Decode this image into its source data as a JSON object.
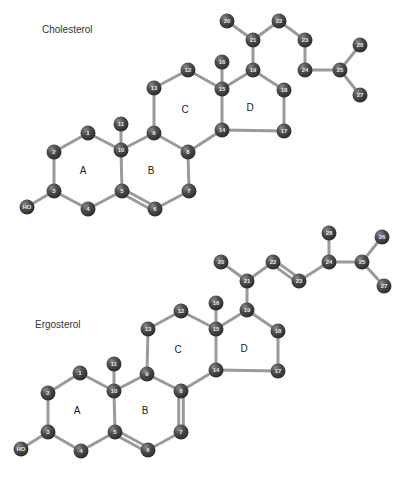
{
  "style": {
    "atom_color": "#4a4a4a",
    "atom_highlight": "#8a8a8a",
    "bond_color": "#9a9a9a",
    "label_color": "#e8e8e8",
    "atom_radius": 7.5
  },
  "molecules": [
    {
      "name": "Cholesterol",
      "title_pos": [
        42,
        33
      ],
      "ring_labels": [
        {
          "text": "A",
          "x": 83,
          "y": 171
        },
        {
          "text": "B",
          "x": 151,
          "y": 171
        },
        {
          "text": "C",
          "x": 185,
          "y": 110
        },
        {
          "text": "D",
          "x": 250,
          "y": 108
        }
      ],
      "atoms": [
        {
          "id": "1",
          "x": 88,
          "y": 133
        },
        {
          "id": "2",
          "x": 54,
          "y": 152
        },
        {
          "id": "3",
          "x": 54,
          "y": 191
        },
        {
          "id": "4",
          "x": 88,
          "y": 209
        },
        {
          "id": "5",
          "x": 122,
          "y": 191
        },
        {
          "id": "6",
          "x": 155,
          "y": 209
        },
        {
          "id": "7",
          "x": 189,
          "y": 191
        },
        {
          "id": "8",
          "x": 188,
          "y": 152
        },
        {
          "id": "9",
          "x": 154,
          "y": 133
        },
        {
          "id": "10",
          "x": 121,
          "y": 150
        },
        {
          "id": "11",
          "x": 121,
          "y": 124
        },
        {
          "id": "12",
          "x": 188,
          "y": 70
        },
        {
          "id": "13",
          "x": 154,
          "y": 88
        },
        {
          "id": "14",
          "x": 222,
          "y": 130
        },
        {
          "id": "15",
          "x": 222,
          "y": 89
        },
        {
          "id": "16",
          "x": 222,
          "y": 62
        },
        {
          "id": "17",
          "x": 284,
          "y": 131
        },
        {
          "id": "18",
          "x": 284,
          "y": 90
        },
        {
          "id": "19",
          "x": 253,
          "y": 70
        },
        {
          "id": "20",
          "x": 227,
          "y": 21
        },
        {
          "id": "21",
          "x": 253,
          "y": 40
        },
        {
          "id": "22",
          "x": 279,
          "y": 21
        },
        {
          "id": "23",
          "x": 305,
          "y": 40
        },
        {
          "id": "24",
          "x": 305,
          "y": 70
        },
        {
          "id": "25",
          "x": 340,
          "y": 70
        },
        {
          "id": "26",
          "x": 360,
          "y": 45
        },
        {
          "id": "27",
          "x": 360,
          "y": 95
        },
        {
          "id": "HO",
          "x": 27,
          "y": 207
        }
      ],
      "bonds": [
        [
          "1",
          "2",
          1
        ],
        [
          "2",
          "3",
          1
        ],
        [
          "3",
          "4",
          1
        ],
        [
          "4",
          "5",
          1
        ],
        [
          "5",
          "10",
          1
        ],
        [
          "10",
          "1",
          1
        ],
        [
          "5",
          "6",
          2
        ],
        [
          "6",
          "7",
          1
        ],
        [
          "7",
          "8",
          1
        ],
        [
          "8",
          "9",
          1
        ],
        [
          "9",
          "10",
          1
        ],
        [
          "10",
          "11",
          1
        ],
        [
          "9",
          "13",
          1
        ],
        [
          "13",
          "12",
          1
        ],
        [
          "12",
          "15",
          1
        ],
        [
          "15",
          "14",
          1
        ],
        [
          "14",
          "8",
          1
        ],
        [
          "15",
          "16",
          1
        ],
        [
          "15",
          "19",
          1
        ],
        [
          "19",
          "18",
          1
        ],
        [
          "18",
          "17",
          1
        ],
        [
          "17",
          "14",
          1
        ],
        [
          "19",
          "21",
          1
        ],
        [
          "21",
          "20",
          1
        ],
        [
          "21",
          "22",
          1
        ],
        [
          "22",
          "23",
          1
        ],
        [
          "23",
          "24",
          1
        ],
        [
          "24",
          "25",
          1
        ],
        [
          "25",
          "26",
          1
        ],
        [
          "25",
          "27",
          1
        ],
        [
          "3",
          "HO",
          1
        ]
      ]
    },
    {
      "name": "Ergosterol",
      "title_pos": [
        35,
        328
      ],
      "ring_labels": [
        {
          "text": "A",
          "x": 77,
          "y": 411
        },
        {
          "text": "B",
          "x": 145,
          "y": 411
        },
        {
          "text": "C",
          "x": 178,
          "y": 350
        },
        {
          "text": "D",
          "x": 244,
          "y": 349
        }
      ],
      "atoms": [
        {
          "id": "1",
          "x": 80,
          "y": 373
        },
        {
          "id": "2",
          "x": 48,
          "y": 393
        },
        {
          "id": "3",
          "x": 48,
          "y": 432
        },
        {
          "id": "4",
          "x": 81,
          "y": 451
        },
        {
          "id": "5",
          "x": 115,
          "y": 432
        },
        {
          "id": "6",
          "x": 148,
          "y": 450
        },
        {
          "id": "7",
          "x": 181,
          "y": 432
        },
        {
          "id": "8",
          "x": 181,
          "y": 391
        },
        {
          "id": "9",
          "x": 147,
          "y": 374
        },
        {
          "id": "10",
          "x": 114,
          "y": 391
        },
        {
          "id": "11",
          "x": 114,
          "y": 364
        },
        {
          "id": "12",
          "x": 181,
          "y": 311
        },
        {
          "id": "13",
          "x": 148,
          "y": 329
        },
        {
          "id": "14",
          "x": 216,
          "y": 370
        },
        {
          "id": "15",
          "x": 216,
          "y": 329
        },
        {
          "id": "16",
          "x": 216,
          "y": 303
        },
        {
          "id": "17",
          "x": 278,
          "y": 371
        },
        {
          "id": "18",
          "x": 278,
          "y": 331
        },
        {
          "id": "19",
          "x": 247,
          "y": 310
        },
        {
          "id": "20",
          "x": 221,
          "y": 262
        },
        {
          "id": "21",
          "x": 247,
          "y": 281
        },
        {
          "id": "22",
          "x": 273,
          "y": 262
        },
        {
          "id": "23",
          "x": 299,
          "y": 281
        },
        {
          "id": "24",
          "x": 329,
          "y": 262
        },
        {
          "id": "25",
          "x": 362,
          "y": 262
        },
        {
          "id": "26",
          "x": 382,
          "y": 237
        },
        {
          "id": "27",
          "x": 384,
          "y": 286
        },
        {
          "id": "28",
          "x": 329,
          "y": 233
        },
        {
          "id": "HO",
          "x": 21,
          "y": 449
        }
      ],
      "bonds": [
        [
          "1",
          "2",
          1
        ],
        [
          "2",
          "3",
          1
        ],
        [
          "3",
          "4",
          1
        ],
        [
          "4",
          "5",
          1
        ],
        [
          "5",
          "10",
          1
        ],
        [
          "10",
          "1",
          1
        ],
        [
          "5",
          "6",
          2
        ],
        [
          "6",
          "7",
          1
        ],
        [
          "7",
          "8",
          2
        ],
        [
          "8",
          "9",
          1
        ],
        [
          "9",
          "10",
          1
        ],
        [
          "10",
          "11",
          1
        ],
        [
          "9",
          "13",
          1
        ],
        [
          "13",
          "12",
          1
        ],
        [
          "12",
          "15",
          1
        ],
        [
          "15",
          "14",
          1
        ],
        [
          "14",
          "8",
          1
        ],
        [
          "15",
          "16",
          1
        ],
        [
          "15",
          "19",
          1
        ],
        [
          "19",
          "18",
          1
        ],
        [
          "18",
          "17",
          1
        ],
        [
          "17",
          "14",
          1
        ],
        [
          "19",
          "21",
          1
        ],
        [
          "21",
          "20",
          1
        ],
        [
          "21",
          "22",
          1
        ],
        [
          "22",
          "23",
          2
        ],
        [
          "23",
          "24",
          1
        ],
        [
          "24",
          "28",
          1
        ],
        [
          "24",
          "25",
          1
        ],
        [
          "25",
          "26",
          1
        ],
        [
          "25",
          "27",
          1
        ],
        [
          "3",
          "HO",
          1
        ]
      ]
    }
  ],
  "caption": {
    "text": "(caption text cut off at bottom edge)"
  }
}
